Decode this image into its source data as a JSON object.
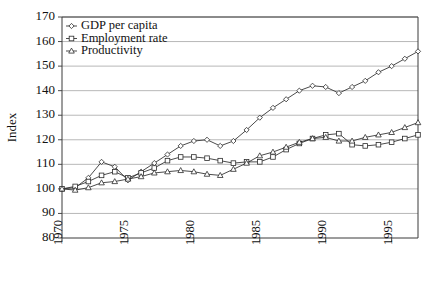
{
  "chart_data": {
    "type": "line",
    "title": "",
    "xlabel": "",
    "ylabel": "Index",
    "xlim": [
      1970,
      1997
    ],
    "ylim": [
      80,
      170
    ],
    "ytick_values": [
      80,
      90,
      100,
      110,
      120,
      130,
      140,
      150,
      160,
      170
    ],
    "ytick_labels": [
      "80",
      "90",
      "100",
      "110",
      "120",
      "130",
      "140",
      "150",
      "160",
      "170"
    ],
    "xtick_values": [
      1970,
      1975,
      1980,
      1985,
      1990,
      1995
    ],
    "xtick_labels": [
      "1970",
      "1975",
      "1980",
      "1985",
      "1990",
      "1995"
    ],
    "grid": "horizontal",
    "legend_position": "top-left",
    "x": [
      1970,
      1971,
      1972,
      1973,
      1974,
      1975,
      1976,
      1977,
      1978,
      1979,
      1980,
      1981,
      1982,
      1983,
      1984,
      1985,
      1986,
      1987,
      1988,
      1989,
      1990,
      1991,
      1992,
      1993,
      1994,
      1995,
      1996,
      1997
    ],
    "series": [
      {
        "name": "GDP per capita",
        "marker": "diamond",
        "values": [
          100,
          100.5,
          104.5,
          111,
          109,
          103.5,
          107,
          110.5,
          114,
          117.5,
          119.5,
          120,
          117.5,
          119.5,
          124,
          129,
          133,
          136.5,
          140,
          142,
          141.5,
          139,
          141.5,
          144,
          147.5,
          150,
          153,
          156
        ]
      },
      {
        "name": "Employment rate",
        "marker": "square",
        "values": [
          100,
          101,
          103,
          105.5,
          107,
          104.5,
          106.5,
          108.5,
          111.5,
          113,
          113,
          112.5,
          111.5,
          110.5,
          111,
          111,
          113,
          116,
          118.5,
          120.5,
          122,
          122.5,
          118,
          117.5,
          118,
          119,
          120.5,
          122
        ]
      },
      {
        "name": "Productivity",
        "marker": "triangle",
        "values": [
          100,
          99.5,
          100.5,
          102.5,
          103,
          104,
          105,
          106.5,
          107,
          107.5,
          107,
          106,
          105.5,
          108,
          110.5,
          113.5,
          115,
          117,
          119,
          120.5,
          121,
          119.5,
          119.5,
          121,
          122,
          123,
          125,
          127
        ]
      }
    ]
  }
}
